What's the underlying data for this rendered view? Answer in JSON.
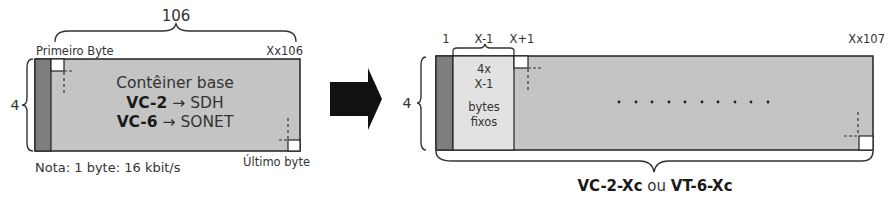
{
  "colors": {
    "container_fill": "#c4c4c4",
    "overhead_column": "#7e7e7e",
    "fixed_bytes_fill": "#e2e2e2",
    "byte_marker": "#ffffff",
    "outline": "#222222",
    "arrow": "#111111"
  },
  "left_diagram": {
    "width_label": "106",
    "rows_label": "4",
    "first_byte_label": "Primeiro Byte",
    "last_column_label": "Xx106",
    "title_line": "Contêiner base",
    "line2_bold": "VC-2",
    "line2_arrow": "→",
    "line2_rest": "SDH",
    "line3_bold": "VC-6",
    "line3_arrow": "→",
    "line3_rest": "SONET",
    "last_byte_label": "Último byte",
    "note": "Nota: 1 byte: 16 kbit/s"
  },
  "arrow": {
    "icon": "right-arrow-icon"
  },
  "right_diagram": {
    "rows_label": "4",
    "col_label_1": "1",
    "col_label_2": "X-1",
    "col_label_3": "X+1",
    "last_column_label": "Xx107",
    "fixed_line1": "4x",
    "fixed_line2": "X-1",
    "fixed_line3": "bytes",
    "fixed_line4": "fixos",
    "ellipsis_dots": 10,
    "caption_bold1": "VC-2-Xc",
    "caption_mid": "ou",
    "caption_bold2": "VT-6-Xc"
  }
}
